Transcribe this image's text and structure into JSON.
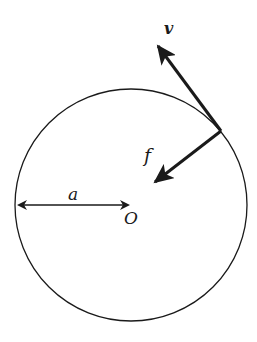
{
  "diagram": {
    "labels": {
      "velocity": "v",
      "force": "f",
      "radius": "a",
      "center": "O"
    },
    "colors": {
      "stroke": "#1a1a1a",
      "background": "#ffffff"
    },
    "circle": {
      "cx": 131,
      "cy": 205,
      "r": 116
    },
    "contact_point": {
      "x": 221,
      "y": 131
    },
    "velocity_tip": {
      "x": 156,
      "y": 43
    },
    "force_tip": {
      "x": 152,
      "y": 185
    },
    "radius_line": {
      "x1": 16,
      "x2": 125,
      "y": 205
    }
  }
}
